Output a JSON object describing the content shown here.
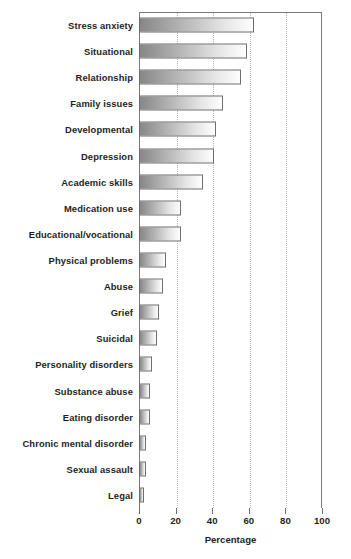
{
  "chart_data": {
    "type": "bar",
    "orientation": "horizontal",
    "title": "",
    "subtitle": "",
    "xlabel": "Percentage",
    "ylabel": "",
    "xlim": [
      0,
      100
    ],
    "ylim": null,
    "xticks": [
      0,
      20,
      40,
      60,
      80,
      100
    ],
    "xtick_labels": [
      "0",
      "20",
      "40",
      "60",
      "80",
      "100"
    ],
    "grid": true,
    "grid_axis": "x",
    "grid_style": "dotted",
    "legend": null,
    "legend_position": "none",
    "annotations": [],
    "bar_fill": "gradient grey left-dark to white-right",
    "bar_edge_color": "#6e6e6e",
    "categories": [
      "Stress anxiety",
      "Situational",
      "Relationship",
      "Family issues",
      "Developmental",
      "Depression",
      "Academic skills",
      "Medication use",
      "Educational/vocational",
      "Physical problems",
      "Abuse",
      "Grief",
      "Suicidal",
      "Personality disorders",
      "Substance abuse",
      "Eating disorder",
      "Chronic mental disorder",
      "Sexual assault",
      "Legal"
    ],
    "values": [
      63,
      59,
      56,
      46,
      42,
      41,
      35,
      23,
      23,
      15,
      13,
      11,
      10,
      7,
      6,
      6,
      4,
      4,
      3
    ]
  },
  "axis": {
    "x_title": "Percentage"
  },
  "colors": {
    "frame": "#7b7b7b",
    "grid": "#b4b4b4",
    "text": "#231f20",
    "bar_start": "#878787",
    "bar_end": "#ffffff",
    "bar_border": "#6e6e6e",
    "background": "#ffffff"
  }
}
